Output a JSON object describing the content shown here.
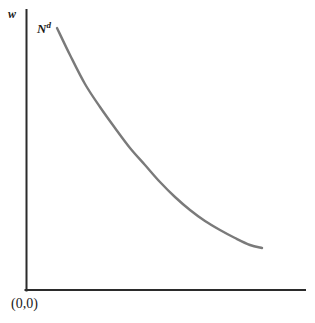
{
  "figure": {
    "background_color": "#ffffff",
    "width": 315,
    "height": 323,
    "axis_color": "#2b2b2b",
    "curve_color": "#7a7a7a",
    "text_color": "#1a1a1a"
  },
  "labels": {
    "y_axis": "w",
    "curve_base": "N",
    "curve_superscript": "d",
    "curve_full": "Nd",
    "origin": "(0,0)"
  },
  "chart_data": {
    "type": "line",
    "title": "",
    "xlabel": "",
    "ylabel": "w",
    "grid": false,
    "legend": "none",
    "annotations": [
      {
        "text": "Nd",
        "x": 38,
        "y": 24,
        "meaning": "labor demand curve label"
      },
      {
        "text": "(0,0)",
        "x": 12,
        "y": 299,
        "meaning": "origin label"
      },
      {
        "text": "w",
        "x": 10,
        "y": 12,
        "meaning": "real wage on vertical axis"
      }
    ],
    "axes": {
      "y_axis_pixels": {
        "x": 26,
        "y_top": 10,
        "y_bottom": 290
      },
      "x_axis_pixels": {
        "y": 290,
        "x_left": 26,
        "x_right": 305
      },
      "xlim": [
        0,
        1
      ],
      "ylim": [
        0,
        1
      ],
      "ticks_shown": false
    },
    "series": [
      {
        "name": "Nd",
        "description": "downward-sloping convex labor demand curve",
        "color": "#7a7a7a",
        "linewidth": 2.4,
        "points_pixels": [
          [
            57,
            28
          ],
          [
            70,
            55
          ],
          [
            85,
            84
          ],
          [
            100,
            107
          ],
          [
            115,
            128
          ],
          [
            130,
            148
          ],
          [
            145,
            165
          ],
          [
            160,
            182
          ],
          [
            175,
            197
          ],
          [
            190,
            210
          ],
          [
            205,
            221
          ],
          [
            220,
            230
          ],
          [
            235,
            238
          ],
          [
            250,
            245
          ],
          [
            262,
            248
          ]
        ],
        "x_normalized": [
          0.111,
          0.158,
          0.212,
          0.265,
          0.319,
          0.373,
          0.427,
          0.48,
          0.534,
          0.588,
          0.642,
          0.695,
          0.749,
          0.803,
          0.846
        ],
        "y_normalized": [
          0.936,
          0.839,
          0.736,
          0.654,
          0.579,
          0.507,
          0.446,
          0.386,
          0.332,
          0.286,
          0.246,
          0.214,
          0.186,
          0.161,
          0.15
        ]
      }
    ]
  }
}
